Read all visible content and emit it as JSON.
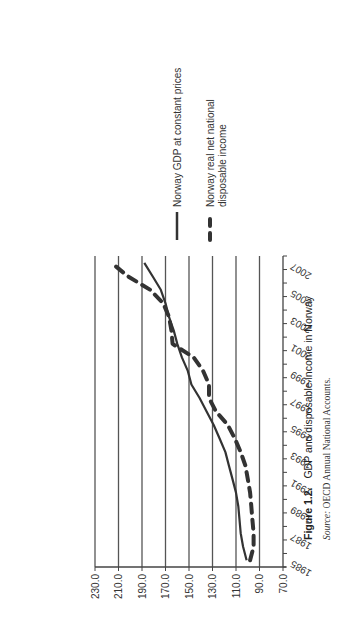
{
  "chart_data": {
    "type": "line",
    "title": "GDP and disposable income in Norway",
    "xlabel": "",
    "ylabel": "",
    "ylim": [
      70,
      230
    ],
    "yticks": [
      "230.0",
      "210.0",
      "190.0",
      "170.0",
      "150.0",
      "130.0",
      "110.0",
      "90.0",
      "70.0"
    ],
    "x": [
      1985,
      1986,
      1987,
      1988,
      1989,
      1990,
      1991,
      1992,
      1993,
      1994,
      1995,
      1996,
      1997,
      1998,
      1999,
      2000,
      2001,
      2002,
      2003,
      2004,
      2005,
      2006,
      2007
    ],
    "xtick_labels": [
      "1985",
      "1987",
      "1989",
      "1991",
      "1993",
      "1995",
      "1997",
      "1999",
      "2001",
      "2003",
      "2005",
      "2007"
    ],
    "grid": true,
    "legend_position": "right",
    "orientation_note": "page rotated 90 degrees counter-clockwise",
    "series": [
      {
        "name": "Norway GDP at constant prices",
        "style": "solid",
        "values": [
          101,
          104,
          106,
          107,
          108,
          110,
          113,
          116,
          119,
          124,
          129,
          135,
          141,
          148,
          151,
          156,
          160,
          163,
          167,
          170,
          174,
          181,
          188
        ]
      },
      {
        "name": "Norway real net national disposable income",
        "style": "dashed",
        "values": [
          98,
          95,
          95,
          96,
          97,
          98,
          100,
          102,
          106,
          111,
          117,
          127,
          133,
          133,
          138,
          146,
          164,
          165,
          167,
          172,
          183,
          202,
          216
        ]
      }
    ]
  },
  "legend": {
    "items": [
      {
        "label_lines": [
          "Norway GDP at constant prices"
        ]
      },
      {
        "label_lines": [
          "Norway real net national",
          "disposable income"
        ]
      }
    ]
  },
  "caption": {
    "figure_number": "Figure 1.2.",
    "title": "GDP and disposable income in Norway",
    "source_label": "Source:",
    "source_text": "OECD Annual National Accounts."
  },
  "colors": {
    "line": "#333333",
    "grid": "#555555",
    "axis": "#444444"
  }
}
